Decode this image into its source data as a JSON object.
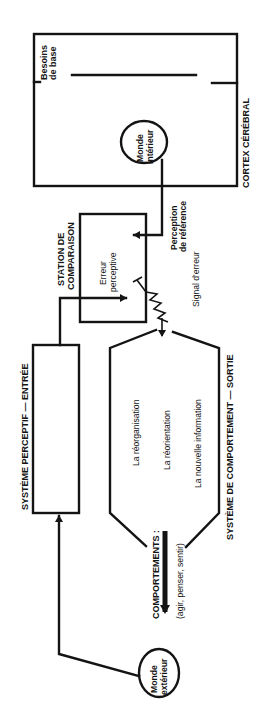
{
  "diagram": {
    "orientation": "rotated 90 degrees counter-clockwise (text reads bottom-to-top)",
    "nodes": {
      "cortex": {
        "label": "CORTEX CÉRÉBRAL",
        "sublabel": "Besoins de base"
      },
      "inner_world": {
        "line1": "Monde",
        "line2": "intérieur"
      },
      "reference": {
        "line1": "Perception",
        "line2": "de référence"
      },
      "comparison_station": {
        "line1": "STATION DE",
        "line2": "COMPARAISON",
        "inner1": "Erreur",
        "inner2": "perceptive"
      },
      "error_signal": {
        "label": "Signal d'erreur"
      },
      "perceptual_system": {
        "label": "SYSTÈME PERCEPTIF — ENTRÉE"
      },
      "behavior_system": {
        "label": "SYSTÈME DE COMPORTEMENT — SORTIE",
        "items": [
          "La réorganisation",
          "La réorientation",
          "La nouvelle information"
        ]
      },
      "behaviors": {
        "line1": "COMPORTEMENTS :",
        "line2": "(agir, penser, sentir)"
      },
      "outer_world": {
        "line1": "Monde",
        "line2": "extérieur"
      }
    },
    "colors": {
      "ink": "#141414",
      "background": "#ffffff"
    }
  }
}
